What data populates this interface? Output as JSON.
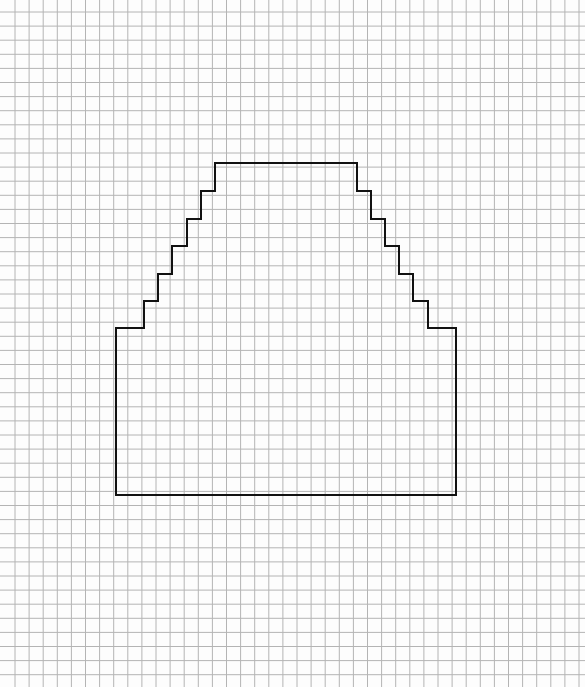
{
  "canvas": {
    "width": 585,
    "height": 687,
    "background": "#fdfdfd"
  },
  "grid": {
    "origin_x": 15,
    "origin_y": 12,
    "spacing": 14.1,
    "line_color": "#b4b4b4",
    "line_width": 1
  },
  "shape": {
    "name": "stepped-trapezoid",
    "stroke": "#111111",
    "stroke_width": 2,
    "points": [
      [
        116,
        495
      ],
      [
        116,
        328
      ],
      [
        144,
        328
      ],
      [
        144,
        301
      ],
      [
        158,
        301
      ],
      [
        158,
        274
      ],
      [
        172,
        274
      ],
      [
        172,
        246
      ],
      [
        187,
        246
      ],
      [
        187,
        219
      ],
      [
        201,
        219
      ],
      [
        201,
        191
      ],
      [
        215,
        191
      ],
      [
        215,
        163
      ],
      [
        357,
        163
      ],
      [
        357,
        191
      ],
      [
        371,
        191
      ],
      [
        371,
        219
      ],
      [
        385,
        219
      ],
      [
        385,
        246
      ],
      [
        399,
        246
      ],
      [
        399,
        274
      ],
      [
        413,
        274
      ],
      [
        413,
        301
      ],
      [
        428,
        301
      ],
      [
        428,
        328
      ],
      [
        456,
        328
      ],
      [
        456,
        495
      ]
    ]
  }
}
